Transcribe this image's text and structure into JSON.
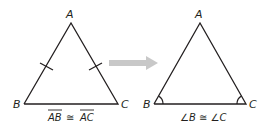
{
  "diagram": {
    "left_triangle": {
      "vertices": {
        "a": "A",
        "b": "B",
        "c": "C"
      },
      "caption": {
        "left": "AB",
        "symbol": "≅",
        "right": "AC"
      },
      "marks": "tick-marks-on-AB-and-AC"
    },
    "arrow": {
      "color": "#c8c8c8",
      "direction": "right"
    },
    "right_triangle": {
      "vertices": {
        "a": "A",
        "b": "B",
        "c": "C"
      },
      "caption": "∠B ≅ ∠C",
      "marks": "angle-arcs-at-B-and-C"
    },
    "colors": {
      "line": "#231f20",
      "arrow": "#c8c8c8"
    }
  }
}
